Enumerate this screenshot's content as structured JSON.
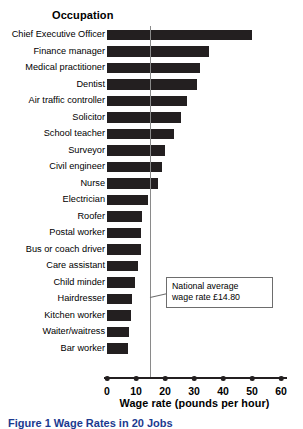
{
  "header": {
    "occupation_label": "Occupation"
  },
  "annotation": {
    "line1": "National average",
    "line2": "wage rate £14.80"
  },
  "caption": {
    "text": "Figure 1 Wage Rates in 20 Jobs"
  },
  "colors": {
    "bar": "#231f20",
    "reference_line": "#8a8a8a",
    "annotation_border": "#6d6d6d",
    "caption": "#1b3a8f",
    "background": "#ffffff"
  },
  "chart_data": {
    "type": "bar",
    "orientation": "horizontal",
    "title": "Occupation",
    "xlabel": "Wage rate (pounds per hour)",
    "ylabel": "Occupation",
    "xlim": [
      0,
      60
    ],
    "xticks": [
      0,
      10,
      20,
      30,
      40,
      50,
      60
    ],
    "grid": false,
    "legend": false,
    "reference_line": {
      "value": 14.8,
      "label": "National average wage rate £14.80"
    },
    "categories": [
      "Chief Executive Officer",
      "Finance manager",
      "Medical practitioner",
      "Dentist",
      "Air traffic controller",
      "Solicitor",
      "School teacher",
      "Surveyor",
      "Civil engineer",
      "Nurse",
      "Electrician",
      "Roofer",
      "Postal worker",
      "Bus or coach driver",
      "Care assistant",
      "Child minder",
      "Hairdresser",
      "Kitchen worker",
      "Waiter/waitress",
      "Bar worker"
    ],
    "values": [
      50,
      35,
      32,
      31,
      27.5,
      25.5,
      23,
      20,
      19,
      17.5,
      14,
      12,
      11.7,
      11.7,
      10.7,
      9.7,
      8.6,
      8.3,
      7.6,
      7.2
    ]
  }
}
